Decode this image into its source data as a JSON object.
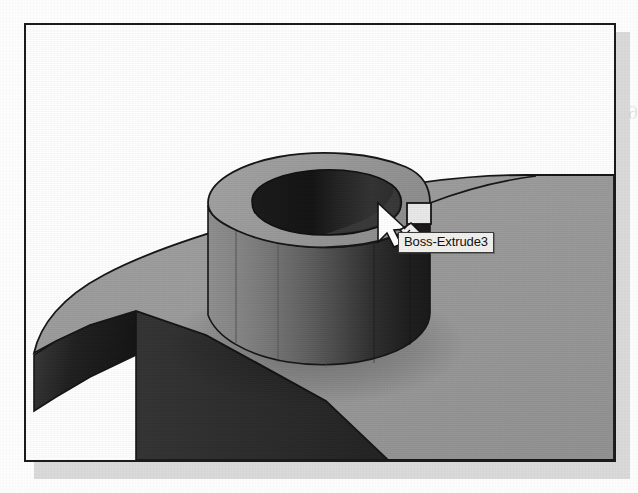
{
  "page": {
    "background_color": "#fdfdfd",
    "show_through_text": "Set the extruded distance to 0.08 inches",
    "show_through_number": "6"
  },
  "screenshot": {
    "border_color": "#1b1b1b",
    "shadow_color": "#bdbdbd",
    "viewport_background": "#fefefe"
  },
  "model": {
    "name": "Boss-Extrude3",
    "description": "Shaded 3D solid: cylindrical boss with through hole on a filleted base plate",
    "colors": {
      "top_face": "#9b9b9b",
      "plate_top_face": "#9a9a9a",
      "boss_side_light": "#8d8d8d",
      "boss_side_mid": "#6f6f6f",
      "boss_side_dark": "#3a3a3a",
      "boss_side_darkest": "#1e1e1e",
      "bore_dark": "#141414",
      "bore_mid": "#2e2e2e",
      "plate_side_dark": "#2a2a2a",
      "plate_fillet_dark": "#1d1d1d",
      "edge_line": "#151515"
    }
  },
  "tooltip": {
    "label": "Boss-Extrude3",
    "background_color": "#f2f1ee",
    "border_color": "#3a3a3a",
    "text_color": "#101010"
  },
  "cursor": {
    "type": "select-face-cursor",
    "arrow_color": "#ffffff",
    "arrow_outline": "#111111",
    "badge_square": "face-badge",
    "badge_diamond": "feature-badge"
  }
}
